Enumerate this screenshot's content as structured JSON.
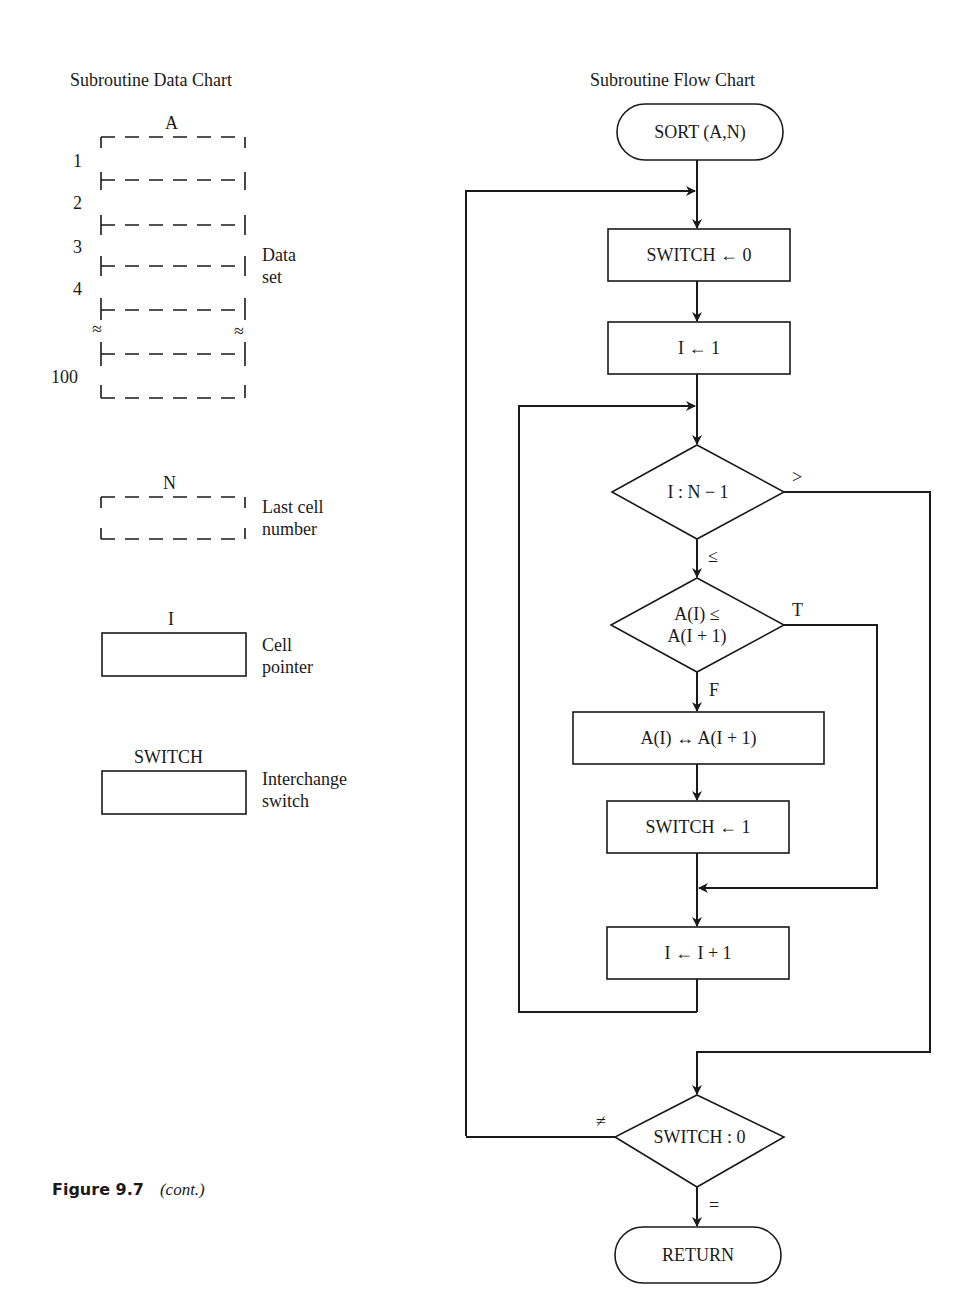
{
  "data_chart": {
    "title": "Subroutine Data Chart",
    "array": {
      "name": "A",
      "row_labels": [
        "1",
        "2",
        "3",
        "4",
        "100"
      ],
      "gap_mark": "≈",
      "description_line1": "Data",
      "description_line2": "set"
    },
    "last_cell": {
      "name": "N",
      "description_line1": "Last cell",
      "description_line2": "number"
    },
    "pointer": {
      "name": "I",
      "description_line1": "Cell",
      "description_line2": "pointer"
    },
    "switch": {
      "name": "SWITCH",
      "description_line1": "Interchange",
      "description_line2": "switch"
    }
  },
  "flow_chart": {
    "title": "Subroutine Flow Chart",
    "start": "SORT (A,N)",
    "init_switch": "SWITCH ← 0",
    "init_i": "I ← 1",
    "decision_bound": "I : N − 1",
    "bound_gt_label": ">",
    "bound_le_label": "≤",
    "decision_compare_line1": "A(I) ≤",
    "decision_compare_line2": "A(I + 1)",
    "compare_true_label": "T",
    "compare_false_label": "F",
    "swap": "A(I) ↔ A(I + 1)",
    "set_switch": "SWITCH ← 1",
    "increment": "I ← I + 1",
    "decision_switch": "SWITCH : 0",
    "switch_ne_label": "≠",
    "switch_eq_label": "=",
    "end": "RETURN"
  },
  "caption": {
    "figure": "Figure 9.7",
    "note": "(cont.)"
  }
}
